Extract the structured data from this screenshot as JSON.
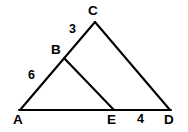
{
  "figure": {
    "type": "geometry-diagram",
    "background_color": "#ffffff",
    "stroke_color": "#000000",
    "canvas": {
      "width": 188,
      "height": 132
    },
    "points": [
      {
        "id": "A",
        "label": "A",
        "x": 20,
        "y": 110
      },
      {
        "id": "B",
        "label": "B",
        "x": 64,
        "y": 58
      },
      {
        "id": "C",
        "label": "C",
        "x": 95,
        "y": 22
      },
      {
        "id": "D",
        "label": "D",
        "x": 170,
        "y": 110
      },
      {
        "id": "E",
        "label": "E",
        "x": 114,
        "y": 110
      }
    ],
    "segments": [
      {
        "id": "AC",
        "from": "A",
        "to": "C",
        "note": "left side, passes through B"
      },
      {
        "id": "AD",
        "from": "A",
        "to": "D",
        "note": "base, passes through E"
      },
      {
        "id": "CD",
        "from": "C",
        "to": "D",
        "note": "right side"
      },
      {
        "id": "BE",
        "from": "B",
        "to": "E",
        "note": "interior segment parallel to CD"
      }
    ],
    "measures": [
      {
        "id": "m-AB",
        "value": "6",
        "on_segment": "AB"
      },
      {
        "id": "m-BC",
        "value": "3",
        "on_segment": "BC"
      },
      {
        "id": "m-ED",
        "value": "4",
        "on_segment": "ED"
      }
    ]
  }
}
